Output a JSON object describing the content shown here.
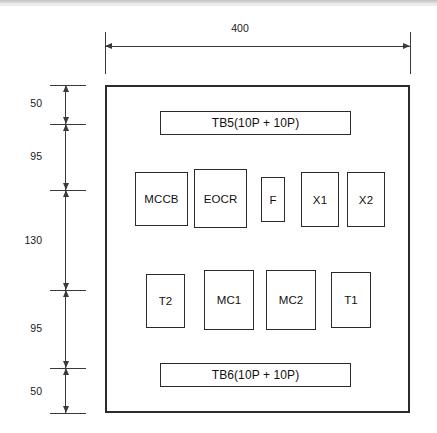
{
  "drawing": {
    "type": "panel-layout-elevation",
    "units": "mm",
    "canvas": {
      "width": 437,
      "height": 433
    },
    "enclosure": {
      "name": "control-panel-enclosure",
      "x": 105,
      "y": 85,
      "width": 305,
      "height": 328,
      "overall_width_label": "400",
      "overall_height_total": "420"
    },
    "horizontal_dimension": {
      "label": "400",
      "x_start": 105,
      "x_end": 410,
      "line_y": 46,
      "label_x": 240,
      "label_y": 22
    },
    "vertical_dimension_chain": {
      "stations_y": [
        85,
        124,
        190,
        290,
        368,
        413
      ],
      "tick_x": 50,
      "tick_width": 36,
      "axis_x": 65,
      "segments": [
        {
          "label": "50",
          "top": 85,
          "bottom": 124,
          "label_y": 97,
          "name": "dim-top-clearance"
        },
        {
          "label": "95",
          "top": 124,
          "bottom": 190,
          "label_y": 150,
          "name": "dim-tb5-to-devices"
        },
        {
          "label": "130",
          "top": 190,
          "bottom": 290,
          "label_y": 234,
          "name": "dim-devices-to-contactors"
        },
        {
          "label": "95",
          "top": 290,
          "bottom": 368,
          "label_y": 322,
          "name": "dim-contactors-to-tb6"
        },
        {
          "label": "50",
          "top": 368,
          "bottom": 413,
          "label_y": 385,
          "name": "dim-bottom-clearance"
        }
      ]
    },
    "components": [
      {
        "name": "terminal-block-tb5",
        "label": "TB5(10P + 10P)",
        "x": 160,
        "y": 111,
        "width": 191,
        "height": 24,
        "row": "top",
        "wide": true
      },
      {
        "name": "component-mccb",
        "label": "MCCB",
        "x": 135,
        "y": 172,
        "width": 53,
        "height": 54,
        "row": "middle",
        "wide": false
      },
      {
        "name": "component-eocr",
        "label": "EOCR",
        "x": 194,
        "y": 169,
        "width": 53,
        "height": 59,
        "row": "middle",
        "wide": false
      },
      {
        "name": "component-f",
        "label": "F",
        "x": 261,
        "y": 177,
        "width": 24,
        "height": 45,
        "row": "middle",
        "wide": false
      },
      {
        "name": "component-x1",
        "label": "X1",
        "x": 301,
        "y": 172,
        "width": 38,
        "height": 55,
        "row": "middle",
        "wide": false
      },
      {
        "name": "component-x2",
        "label": "X2",
        "x": 347,
        "y": 172,
        "width": 38,
        "height": 55,
        "row": "middle",
        "wide": false
      },
      {
        "name": "component-t2",
        "label": "T2",
        "x": 146,
        "y": 274,
        "width": 39,
        "height": 54,
        "row": "bottom",
        "wide": false
      },
      {
        "name": "component-mc1",
        "label": "MC1",
        "x": 204,
        "y": 270,
        "width": 50,
        "height": 60,
        "row": "bottom",
        "wide": false
      },
      {
        "name": "component-mc2",
        "label": "MC2",
        "x": 266,
        "y": 270,
        "width": 50,
        "height": 60,
        "row": "bottom",
        "wide": false
      },
      {
        "name": "component-t1",
        "label": "T1",
        "x": 331,
        "y": 272,
        "width": 40,
        "height": 56,
        "row": "bottom",
        "wide": false
      },
      {
        "name": "terminal-block-tb6",
        "label": "TB6(10P + 10P)",
        "x": 160,
        "y": 363,
        "width": 191,
        "height": 24,
        "row": "bottom",
        "wide": true
      }
    ]
  }
}
